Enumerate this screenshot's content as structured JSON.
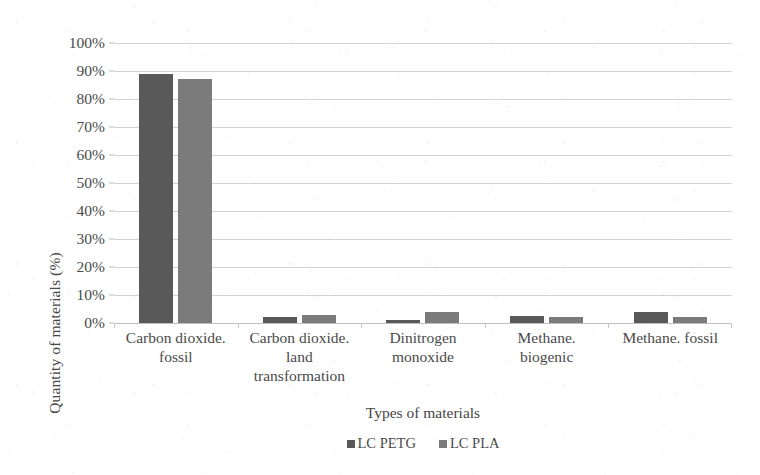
{
  "chart_data": {
    "type": "bar",
    "title": "",
    "xlabel": "Types of materials",
    "ylabel": "Quantity of materials (%)",
    "ylim": [
      0,
      100
    ],
    "ytick_labels": [
      "100%",
      "90%",
      "80%",
      "70%",
      "60%",
      "50%",
      "40%",
      "30%",
      "20%",
      "10%",
      "0%"
    ],
    "ytick_values": [
      100,
      90,
      80,
      70,
      60,
      50,
      40,
      30,
      20,
      10,
      0
    ],
    "grid": true,
    "legend_position": "bottom",
    "categories": [
      "Carbon dioxide. fossil",
      "Carbon dioxide. land transformation",
      "Dinitrogen monoxide",
      "Methane. biogenic",
      "Methane. fossil"
    ],
    "category_lines": [
      [
        "Carbon dioxide.",
        "fossil"
      ],
      [
        "Carbon dioxide.",
        "land",
        "transformation"
      ],
      [
        "Dinitrogen",
        "monoxide"
      ],
      [
        "Methane.",
        "biogenic"
      ],
      [
        "Methane. fossil"
      ]
    ],
    "series": [
      {
        "name": "LC PETG",
        "color": "#595959",
        "values": [
          89,
          2,
          1,
          2.5,
          4
        ]
      },
      {
        "name": "LC PLA",
        "color": "#7b7b7b",
        "values": [
          87,
          3,
          4,
          2,
          2
        ]
      }
    ]
  },
  "legend": {
    "items": [
      {
        "label": "LC PETG",
        "color": "#595959"
      },
      {
        "label": "LC PLA",
        "color": "#7b7b7b"
      }
    ]
  },
  "colors": {
    "gridline": "#d3d3d3",
    "baseline": "#bfbfbf",
    "text": "#4a4a4a",
    "background": "#ffffff"
  }
}
